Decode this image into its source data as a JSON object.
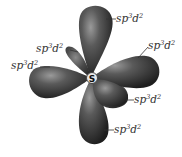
{
  "diagram": {
    "center_atom": "S",
    "geometry": "octahedral",
    "orbital_color": "#3a3a3a",
    "orbital_highlight": "#8a8a8a",
    "labels": [
      {
        "id": "top",
        "base": "sp",
        "sup1": "3",
        "mid": "d",
        "sup2": "2"
      },
      {
        "id": "upper-left",
        "base": "sp",
        "sup1": "3",
        "mid": "d",
        "sup2": "2"
      },
      {
        "id": "left",
        "base": "sp",
        "sup1": "3",
        "mid": "d",
        "sup2": "2"
      },
      {
        "id": "upper-right",
        "base": "sp",
        "sup1": "3",
        "mid": "d",
        "sup2": "2"
      },
      {
        "id": "lower-right",
        "base": "sp",
        "sup1": "3",
        "mid": "d",
        "sup2": "2"
      },
      {
        "id": "bottom",
        "base": "sp",
        "sup1": "3",
        "mid": "d",
        "sup2": "2"
      }
    ]
  }
}
